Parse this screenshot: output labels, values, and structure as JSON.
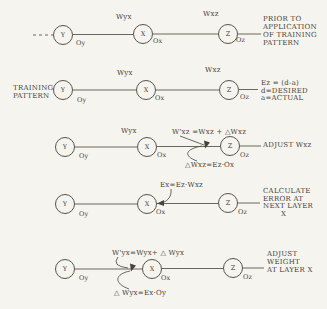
{
  "diagram": {
    "nodes": {
      "y": "Y",
      "x": "X",
      "z": "Z"
    },
    "outputs": {
      "oy": "Oy",
      "ox": "Ox",
      "oz": "Oz"
    },
    "weights": {
      "wyx": "Wyx",
      "wxz": "Wxz"
    }
  },
  "rows": [
    {
      "caption": [
        "PRIOR TO",
        "APPLICATION",
        "OF TRAINING",
        "PATTERN"
      ]
    },
    {
      "left": [
        "TRAINING",
        "PATTERN"
      ],
      "caption": [
        "Ez = (d-a)",
        "d=DESIRED",
        "a=ACTUAL"
      ]
    },
    {
      "formula_top": "W'xz =Wxz + △Wxz",
      "formula_bottom": "△Wxz=Ez·Ox",
      "caption": [
        "ADJUST Wxz"
      ]
    },
    {
      "formula_top": "Ex=Ez·Wxz",
      "caption": [
        "CALCULATE",
        "ERROR AT",
        "NEXT LAYER",
        "X"
      ]
    },
    {
      "formula_top": "W'yx=Wyx+ △ Wyx",
      "formula_bottom": "△ Wyx=Ex·Oy",
      "caption": [
        "ADJUST",
        "WEIGHT",
        "AT LAYER X"
      ]
    }
  ],
  "colors": {
    "paper": "#f6f4ef",
    "ink": "#474339",
    "line": "#5b574d"
  }
}
